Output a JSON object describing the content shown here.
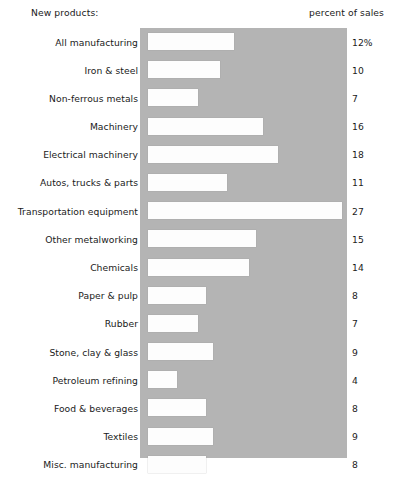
{
  "header": {
    "left_label": "New products:",
    "right_label": "percent of sales"
  },
  "panel": {
    "background_color": "#b4b4b4",
    "bar_color": "#fdfdfd"
  },
  "chart_data": {
    "type": "bar",
    "orientation": "horizontal",
    "title": "New products:",
    "xlabel": "percent of sales",
    "ylabel": "",
    "grid": false,
    "legend": false,
    "xlim": [
      0,
      28.8
    ],
    "categories": [
      "All manufacturing",
      "Iron & steel",
      "Non-ferrous metals",
      "Machinery",
      "Electrical machinery",
      "Autos, trucks & parts",
      "Transportation equipment",
      "Other metalworking",
      "Chemicals",
      "Paper & pulp",
      "Rubber",
      "Stone, clay & glass",
      "Petroleum refining",
      "Food & beverages",
      "Textiles",
      "Misc. manufacturing"
    ],
    "values": [
      12,
      10,
      7,
      16,
      18,
      11,
      27,
      15,
      14,
      8,
      7,
      9,
      4,
      8,
      9,
      8
    ],
    "value_labels": [
      "12%",
      "10",
      "7",
      "16",
      "18",
      "11",
      "27",
      "15",
      "14",
      "8",
      "7",
      "9",
      "4",
      "8",
      "9",
      "8"
    ],
    "rows": [
      {
        "label": "All manufacturing",
        "value": 12,
        "value_label": "12%"
      },
      {
        "label": "Iron & steel",
        "value": 10,
        "value_label": "10"
      },
      {
        "label": "Non-ferrous metals",
        "value": 7,
        "value_label": "7"
      },
      {
        "label": "Machinery",
        "value": 16,
        "value_label": "16"
      },
      {
        "label": "Electrical machinery",
        "value": 18,
        "value_label": "18"
      },
      {
        "label": "Autos, trucks & parts",
        "value": 11,
        "value_label": "11"
      },
      {
        "label": "Transportation equipment",
        "value": 27,
        "value_label": "27"
      },
      {
        "label": "Other metalworking",
        "value": 15,
        "value_label": "15"
      },
      {
        "label": "Chemicals",
        "value": 14,
        "value_label": "14"
      },
      {
        "label": "Paper & pulp",
        "value": 8,
        "value_label": "8"
      },
      {
        "label": "Rubber",
        "value": 7,
        "value_label": "7"
      },
      {
        "label": "Stone, clay & glass",
        "value": 9,
        "value_label": "9"
      },
      {
        "label": "Petroleum refining",
        "value": 4,
        "value_label": "4"
      },
      {
        "label": "Food & beverages",
        "value": 8,
        "value_label": "8"
      },
      {
        "label": "Textiles",
        "value": 9,
        "value_label": "9"
      },
      {
        "label": "Misc. manufacturing",
        "value": 8,
        "value_label": "8"
      }
    ]
  }
}
